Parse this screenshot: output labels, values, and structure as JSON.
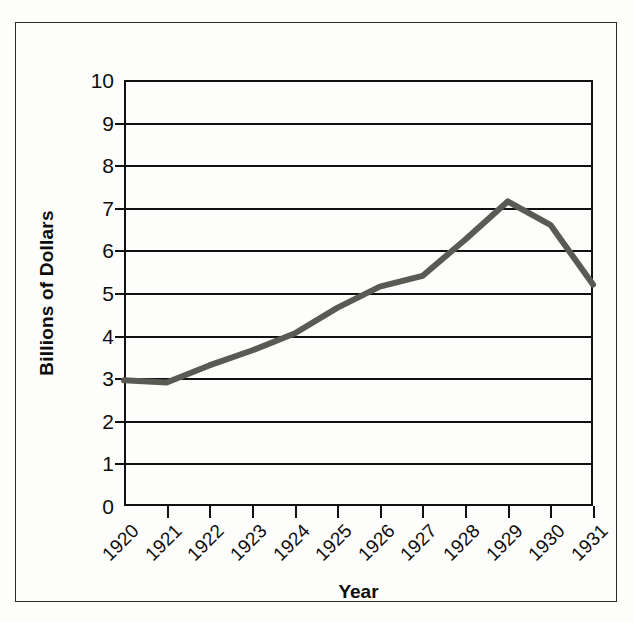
{
  "chart_data": {
    "type": "line",
    "title": "",
    "xlabel": "Year",
    "ylabel": "Billions of Dollars",
    "x": [
      1920,
      1921,
      1922,
      1923,
      1924,
      1925,
      1926,
      1927,
      1928,
      1929,
      1930,
      1931
    ],
    "categories": [
      "1920",
      "1921",
      "1922",
      "1923",
      "1924",
      "1925",
      "1926",
      "1927",
      "1928",
      "1929",
      "1930",
      "1931"
    ],
    "values": [
      2.95,
      2.9,
      3.3,
      3.65,
      4.05,
      4.65,
      5.15,
      5.4,
      6.25,
      7.15,
      6.6,
      5.2
    ],
    "series": [
      {
        "name": "Billions of Dollars",
        "values": [
          2.95,
          2.9,
          3.3,
          3.65,
          4.05,
          4.65,
          5.15,
          5.4,
          6.25,
          7.15,
          6.6,
          5.2
        ]
      }
    ],
    "xlim": [
      1920,
      1931
    ],
    "ylim": [
      0,
      10
    ],
    "ytick_labels": [
      "10",
      "9",
      "8",
      "7",
      "6",
      "5",
      "4",
      "3",
      "2",
      "1",
      "0"
    ],
    "ytick_values": [
      10,
      9,
      8,
      7,
      6,
      5,
      4,
      3,
      2,
      1,
      0
    ],
    "grid": true,
    "grid_axis": "y",
    "legend": false,
    "legend_position": "none",
    "line_color": "#5a5a55",
    "axis_color": "#111111",
    "background_color": "#fdfdfc",
    "line_width": 6
  }
}
